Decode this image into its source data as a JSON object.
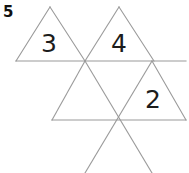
{
  "page": {
    "question_number": "5",
    "width": 189,
    "height": 173,
    "background_color": "#ffffff"
  },
  "figure": {
    "name": "triangle-grid-puzzle",
    "line_color": "#9a9a9a",
    "line_width": 1.1,
    "number_color": "#1c1c1c",
    "triangles": [
      {
        "id": "triangle-3",
        "label": "3",
        "orientation": "up",
        "points": "16,61 50,7 85,61",
        "label_x": 49,
        "label_y": 43
      },
      {
        "id": "triangle-4",
        "label": "4",
        "orientation": "up",
        "points": "85,61 119,7 154,61",
        "label_x": 119,
        "label_y": 43
      },
      {
        "id": "triangle-middle-blank",
        "label": "",
        "orientation": "up",
        "points": "52,120 85,61 118,120",
        "label_x": 85,
        "label_y": 102
      },
      {
        "id": "triangle-2",
        "label": "2",
        "orientation": "up",
        "points": "118,120 152,61 186,120",
        "label_x": 153,
        "label_y": 99
      }
    ],
    "extra_lines": [
      {
        "id": "crossing-line-left",
        "x1": 85,
        "y1": 61,
        "x2": 152,
        "y2": 173
      },
      {
        "id": "crossing-line-right",
        "x1": 152,
        "y1": 61,
        "x2": 85,
        "y2": 173
      },
      {
        "id": "upper-row-baseline",
        "x1": 16,
        "y1": 61,
        "x2": 186,
        "y2": 61
      },
      {
        "id": "middle-row-baseline",
        "x1": 52,
        "y1": 120,
        "x2": 186,
        "y2": 120
      }
    ]
  }
}
